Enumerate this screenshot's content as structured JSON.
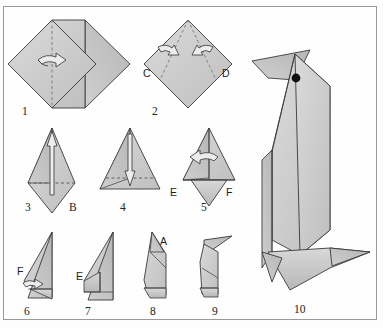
{
  "figure": {
    "total_steps": 10,
    "border_color": "#9a9a9a",
    "background_color": "#fefefe",
    "paper_fill_light": "#d6d6d6",
    "paper_fill_mid": "#c2c2c2",
    "paper_fill_dark": "#b0b0b0",
    "outline_color": "#3a3a3a",
    "fold_line_color": "#6e6e6e",
    "arrow_fill": "#e8e8e8",
    "eye_color": "#111111"
  },
  "steps": [
    {
      "number": "1",
      "number_x": 22,
      "number_y": 115,
      "description": "Square base diamond with vertical valley fold; fold right half back",
      "arrow": "curved-right-arrow",
      "fold_lines": [
        "vertical-center-dashed"
      ],
      "point_labels": []
    },
    {
      "number": "2",
      "number_x": 152,
      "number_y": 115,
      "description": "Fold side corners C and D inward to center line",
      "arrow": "two-inward-arrows",
      "fold_lines": [
        "left-diagonal-dashed",
        "right-diagonal-dashed"
      ],
      "point_labels": [
        {
          "text": "C",
          "x": 143,
          "y": 77
        },
        {
          "text": "D",
          "x": 222,
          "y": 77
        }
      ]
    },
    {
      "number": "3",
      "number_x": 25,
      "number_y": 211,
      "description": "Kite shape; fold bottom point B upward along horizontal crease",
      "arrow": "up-arrow",
      "fold_lines": [
        "horizontal-dashed"
      ],
      "point_labels": [
        {
          "text": "B",
          "x": 69,
          "y": 211
        }
      ]
    },
    {
      "number": "4",
      "number_x": 120,
      "number_y": 211,
      "description": "Triangle; fold flap back down along horizontal crease",
      "arrow": "down-arrow",
      "fold_lines": [
        "horizontal-dashed"
      ],
      "point_labels": []
    },
    {
      "number": "5",
      "number_x": 201,
      "number_y": 211,
      "description": "Fold model in half from right to left between points E and F",
      "arrow": "curved-left-arrow",
      "fold_lines": [
        "vertical-center"
      ],
      "point_labels": [
        {
          "text": "E",
          "x": 170,
          "y": 196
        },
        {
          "text": "F",
          "x": 226,
          "y": 196
        }
      ]
    },
    {
      "number": "6",
      "number_x": 24,
      "number_y": 315,
      "description": "Side view; pull point F outward to the right to form the foot",
      "arrow": "small-right-arrow",
      "fold_lines": [
        "foot-crease"
      ],
      "point_labels": [
        {
          "text": "F",
          "x": 20,
          "y": 272
        }
      ]
    },
    {
      "number": "7",
      "number_x": 85,
      "number_y": 315,
      "description": "Repeat on the other side with point E",
      "arrow": "none",
      "fold_lines": [
        "inner-crease"
      ],
      "point_labels": [
        {
          "text": "E",
          "x": 79,
          "y": 277
        }
      ]
    },
    {
      "number": "8",
      "number_x": 150,
      "number_y": 315,
      "description": "Reverse fold the top point A to shape the head",
      "arrow": "none",
      "fold_lines": [
        "head-crease"
      ],
      "point_labels": [
        {
          "text": "A",
          "x": 161,
          "y": 245
        }
      ]
    },
    {
      "number": "9",
      "number_x": 212,
      "number_y": 315,
      "description": "Reverse fold the tip to form the beak",
      "arrow": "none",
      "fold_lines": [
        "beak-crease"
      ],
      "point_labels": []
    },
    {
      "number": "10",
      "number_x": 294,
      "number_y": 313,
      "description": "Finished penguin standing upright with eye marked",
      "arrow": "none",
      "fold_lines": [
        "body-creases"
      ],
      "point_labels": []
    }
  ]
}
